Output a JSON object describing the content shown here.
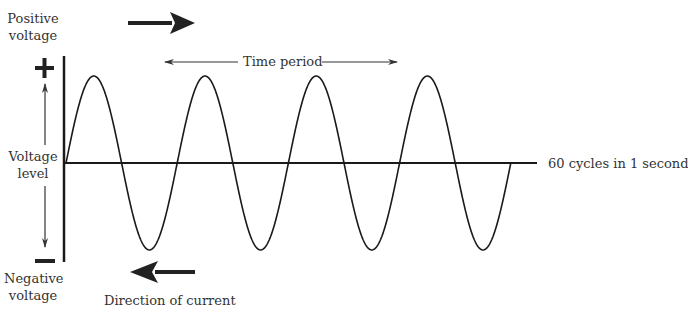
{
  "diagram": {
    "labels": {
      "positive_voltage_line1": "Positive",
      "positive_voltage_line2": "voltage",
      "negative_voltage_line1": "Negative",
      "negative_voltage_line2": "voltage",
      "voltage_level_line1": "Voltage",
      "voltage_level_line2": "level",
      "time_period": "Time period",
      "frequency": "60 cycles in 1 second",
      "direction_of_current": "Direction of current",
      "plus_sign": "+",
      "minus_sign": "—"
    },
    "wave": {
      "cycles_shown": 4,
      "axis_y": 163,
      "amplitude_px": 87,
      "start_x": 66,
      "half_period_px": 55.6,
      "color": "#1a1a1a"
    },
    "arrows": {
      "positive_direction": "right",
      "negative_direction": "left"
    }
  }
}
